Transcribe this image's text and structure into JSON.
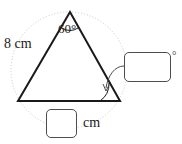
{
  "figure": {
    "name": "triangle-with-circumcircle",
    "stroke_color": "#1a1a1a",
    "circle_color": "#c8c8c8",
    "box_border_color": "#4d4d4d",
    "triangle": {
      "apex": [
        70,
        12
      ],
      "bottom_left": [
        18,
        101
      ],
      "bottom_right": [
        120,
        101
      ]
    },
    "circumcircle": {
      "center": [
        69,
        70
      ],
      "radius": 58,
      "style": "dotted"
    }
  },
  "labels": {
    "side_left": "8 cm",
    "angle_apex": "60°",
    "unit_bottom": "cm",
    "degree_symbol": "°"
  },
  "answers": {
    "angle_value": "",
    "angle_placeholder": "",
    "side_value": "",
    "side_placeholder": ""
  },
  "annotations": {
    "apex_angle_arc": "arc-at-apex",
    "bottom_right_angle_arc": "arc-at-bottom-right",
    "leader_line": "curved-arrow-to-angle-box"
  }
}
